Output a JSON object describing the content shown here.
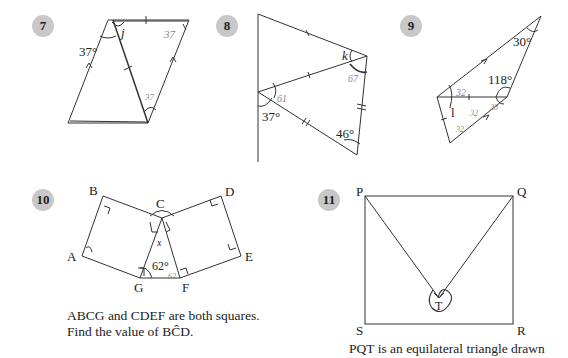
{
  "problems": [
    {
      "number": "7",
      "labels": {
        "angle_given": "37°",
        "unknown": "j",
        "note_bottom": "37",
        "note_right": "37"
      }
    },
    {
      "number": "8",
      "labels": {
        "unknown": "k",
        "angle_left": "37°",
        "angle_bottom": "46°",
        "note_k": "67",
        "note_mid": "61"
      }
    },
    {
      "number": "9",
      "labels": {
        "angle_top": "30°",
        "angle_mid": "118°",
        "unknown": "l",
        "note_top": "32",
        "note_mid": "32",
        "note_right": "28",
        "note_bottom": "32"
      }
    },
    {
      "number": "10",
      "labels": {
        "A": "A",
        "B": "B",
        "C": "C",
        "D": "D",
        "E": "E",
        "F": "F",
        "G": "G",
        "angle_G": "62°",
        "note_x": "x",
        "note_F": "62"
      },
      "caption_lines": [
        "ABCG and CDEF are both squares.",
        "Find the value of BĈD."
      ]
    },
    {
      "number": "11",
      "labels": {
        "P": "P",
        "Q": "Q",
        "R": "R",
        "S": "S",
        "T": "T"
      },
      "caption_lines": [
        "PQT is an equilateral triangle drawn"
      ]
    }
  ]
}
